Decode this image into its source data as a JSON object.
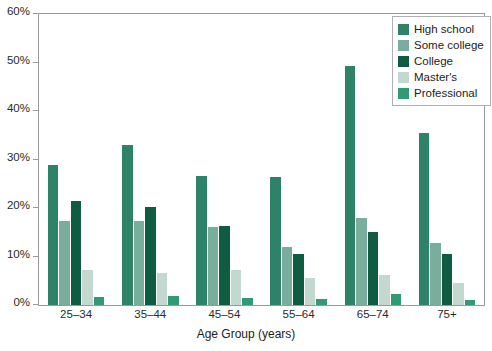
{
  "chart_data": {
    "type": "bar",
    "title": "",
    "xlabel": "Age Group (years)",
    "ylabel": "",
    "categories": [
      "25–34",
      "35–44",
      "45–54",
      "55–64",
      "65–74",
      "75+"
    ],
    "series": [
      {
        "name": "High school",
        "color": "#2e8268",
        "values": [
          28.9,
          32.9,
          26.7,
          26.3,
          49.3,
          35.5
        ]
      },
      {
        "name": "Some college",
        "color": "#78ae9b",
        "values": [
          17.4,
          17.3,
          16.0,
          12.0,
          18.0,
          12.8
        ]
      },
      {
        "name": "College",
        "color": "#0f5c42",
        "values": [
          21.5,
          20.2,
          16.2,
          10.5,
          15.1,
          10.6
        ]
      },
      {
        "name": "Master's",
        "color": "#c3d8cf",
        "values": [
          7.2,
          6.5,
          7.3,
          5.5,
          6.2,
          4.5
        ]
      },
      {
        "name": "Professional",
        "color": "#2f9a74",
        "values": [
          1.7,
          1.8,
          1.5,
          1.2,
          2.2,
          1.0
        ]
      }
    ],
    "ylim": [
      0,
      60
    ],
    "y_ticks": [
      0,
      10,
      20,
      30,
      40,
      50,
      60
    ],
    "y_tick_labels": [
      "0%",
      "10%",
      "20%",
      "30%",
      "40%",
      "50%",
      "60%"
    ],
    "grid": false,
    "legend_position": "top-right"
  },
  "legend": {
    "items": [
      {
        "label": "High school"
      },
      {
        "label": "Some college"
      },
      {
        "label": "College"
      },
      {
        "label": "Master's"
      },
      {
        "label": "Professional"
      }
    ]
  },
  "axes": {
    "x_title": "Age Group (years)"
  }
}
